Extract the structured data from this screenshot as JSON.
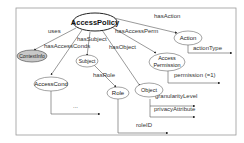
{
  "diagram": {
    "nodes": {
      "access_policy": "AccessPolicy",
      "context_info": "ContextInfo",
      "subject": "Subject",
      "access_cond": "AccessCond",
      "role": "Role",
      "object": "Object",
      "action": "Action",
      "access_permission_line1": "Access",
      "access_permission_line2": "Permission"
    },
    "edges": {
      "uses": "uses",
      "has_access_conds": "hasAccessConds",
      "has_subject": "hasSubject",
      "has_object": "hasObject",
      "has_access_perm": "hasAccessPerm",
      "has_action": "hasAction",
      "has_role": "hasRole",
      "action_type": "actionType",
      "permission": "permission (=1)",
      "granularity_level": "granularityLevel",
      "privacy_attribute": "privacyAttribute",
      "role_id": "roleID",
      "access_cond_ellipsis": "..."
    },
    "colors": {
      "context_info_fill": "#c8c8c8",
      "frame": "#999999"
    }
  }
}
